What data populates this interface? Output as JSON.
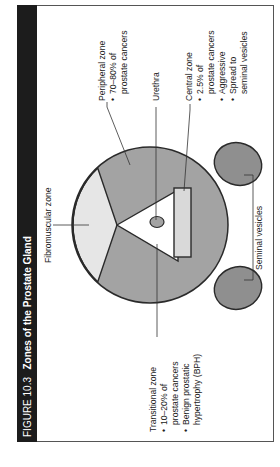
{
  "figure": {
    "number_label": "FIGURE 10.3",
    "title": "Zones of the Prostate Gland",
    "orientation": "rotated 90° counter-clockwise",
    "colors": {
      "title_bar": "#1c1c1c",
      "frame": "#555555",
      "peripheral_fill": "#a3a3a3",
      "fibromuscular_fill": "#e6e6e6",
      "central_fill": "#d9d9d9",
      "vesicle_fill": "#8f8f8f",
      "outline": "#2a2a2a"
    }
  },
  "labels": {
    "peripheral": {
      "name": "Peripheral zone",
      "bullets": [
        [
          "70–80% of",
          "prostate cancers"
        ]
      ]
    },
    "urethra": {
      "name": "Urethra"
    },
    "central": {
      "name": "Central zone",
      "bullets": [
        [
          "2.5% of",
          "prostate cancers"
        ],
        [
          "Aggressive"
        ],
        [
          "Spread to",
          "seminal vesicles"
        ]
      ]
    },
    "fibromuscular": {
      "name": "Fibromuscular zone"
    },
    "seminal_vesicles": {
      "name": "Seminal vesicles"
    },
    "transitional": {
      "name": "Transitional zone",
      "bullets": [
        [
          "10–20% of",
          "prostate cancers"
        ],
        [
          "Benign prostatic",
          "hypertrophy (BPH)"
        ]
      ]
    }
  },
  "bullet_glyph": "•"
}
